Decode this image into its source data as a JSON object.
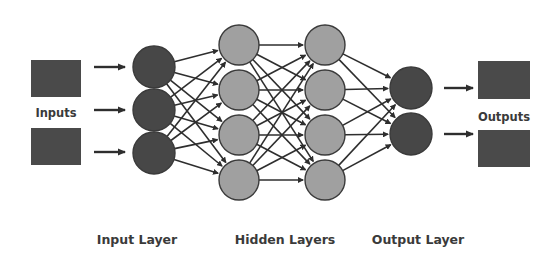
{
  "diagram": {
    "colors": {
      "background": "#ffffff",
      "box_fill": "#4a4a4a",
      "dark_node_fill": "#474747",
      "hidden_node_fill": "#a0a0a0",
      "node_stroke": "#3a3a3a",
      "edge": "#2e2e2e",
      "text": "#3a3a3a"
    },
    "io_labels": {
      "inputs": "Inputs",
      "outputs": "Outputs"
    },
    "layer_labels": [
      {
        "id": "input",
        "label": "Input Layer",
        "x": 137
      },
      {
        "id": "hidden",
        "label": "Hidden Layers",
        "x": 285
      },
      {
        "id": "output",
        "label": "Output Layer",
        "x": 418
      }
    ],
    "input_boxes": [
      {
        "x": 31,
        "y": 60,
        "w": 50,
        "h": 37
      },
      {
        "x": 31,
        "y": 128,
        "w": 50,
        "h": 37
      }
    ],
    "output_boxes": [
      {
        "x": 478,
        "y": 61,
        "w": 52,
        "h": 38
      },
      {
        "x": 478,
        "y": 130,
        "w": 52,
        "h": 37
      }
    ],
    "input_arrows": [
      {
        "x1": 94,
        "x2": 127,
        "y": 67
      },
      {
        "x1": 94,
        "x2": 127,
        "y": 110
      },
      {
        "x1": 94,
        "x2": 127,
        "y": 152
      }
    ],
    "output_arrows": [
      {
        "x1": 444,
        "x2": 475,
        "y": 88
      },
      {
        "x1": 444,
        "x2": 475,
        "y": 134
      }
    ],
    "layers": [
      {
        "name": "input",
        "x": 154,
        "r": 21,
        "fill": "dark",
        "nodes_y": [
          67,
          110,
          153
        ]
      },
      {
        "name": "hidden-1",
        "x": 239,
        "r": 20,
        "fill": "hidden",
        "nodes_y": [
          45,
          90,
          135,
          180
        ]
      },
      {
        "name": "hidden-2",
        "x": 325,
        "r": 20,
        "fill": "hidden",
        "nodes_y": [
          45,
          90,
          135,
          180
        ]
      },
      {
        "name": "output",
        "x": 411,
        "r": 21,
        "fill": "dark",
        "nodes_y": [
          88,
          134
        ]
      }
    ]
  }
}
